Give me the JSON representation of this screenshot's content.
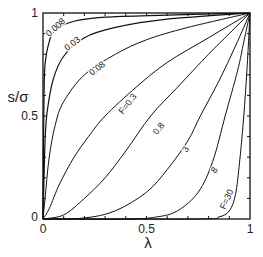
{
  "chart_data": {
    "type": "line",
    "title": "",
    "xlabel": "λ",
    "ylabel": "s/σ",
    "xlim": [
      0,
      1
    ],
    "ylim": [
      0,
      1
    ],
    "grid": false,
    "legend": "inline curve labels",
    "x_ticks": [
      {
        "value": 0,
        "label": "0"
      },
      {
        "value": 0.5,
        "label": "0.5"
      },
      {
        "value": 1,
        "label": "1"
      }
    ],
    "y_ticks": [
      {
        "value": 0,
        "label": "0"
      },
      {
        "value": 0.5,
        "label": "0.5"
      },
      {
        "value": 1,
        "label": "1"
      }
    ],
    "series": [
      {
        "name": "0.008",
        "label": "0.008",
        "label_pos": [
          0.07,
          0.92
        ],
        "label_rot": 42,
        "points": [
          [
            0,
            0
          ],
          [
            0.002,
            0.3
          ],
          [
            0.005,
            0.6
          ],
          [
            0.01,
            0.75
          ],
          [
            0.03,
            0.86
          ],
          [
            0.06,
            0.92
          ],
          [
            0.15,
            0.96
          ],
          [
            0.3,
            0.98
          ],
          [
            0.6,
            0.99
          ],
          [
            1,
            1
          ]
        ]
      },
      {
        "name": "0.03",
        "label": "0.03",
        "label_pos": [
          0.15,
          0.84
        ],
        "label_rot": 38,
        "points": [
          [
            0,
            0
          ],
          [
            0.005,
            0.2
          ],
          [
            0.01,
            0.38
          ],
          [
            0.02,
            0.52
          ],
          [
            0.05,
            0.68
          ],
          [
            0.1,
            0.79
          ],
          [
            0.2,
            0.88
          ],
          [
            0.35,
            0.93
          ],
          [
            0.6,
            0.97
          ],
          [
            1,
            1
          ]
        ]
      },
      {
        "name": "0.08",
        "label": "0.08",
        "label_pos": [
          0.27,
          0.72
        ],
        "label_rot": 38,
        "points": [
          [
            0,
            0
          ],
          [
            0.01,
            0.1
          ],
          [
            0.03,
            0.3
          ],
          [
            0.06,
            0.46
          ],
          [
            0.1,
            0.57
          ],
          [
            0.2,
            0.7
          ],
          [
            0.35,
            0.8
          ],
          [
            0.5,
            0.87
          ],
          [
            0.7,
            0.93
          ],
          [
            1,
            1
          ]
        ]
      },
      {
        "name": "0.3",
        "label": "F=0.3",
        "label_pos": [
          0.42,
          0.55
        ],
        "label_rot": 52,
        "points": [
          [
            0,
            0
          ],
          [
            0.03,
            0.05
          ],
          [
            0.08,
            0.17
          ],
          [
            0.15,
            0.3
          ],
          [
            0.22,
            0.4
          ],
          [
            0.3,
            0.5
          ],
          [
            0.45,
            0.64
          ],
          [
            0.6,
            0.76
          ],
          [
            0.8,
            0.88
          ],
          [
            1,
            1
          ]
        ]
      },
      {
        "name": "0.8",
        "label": "0.8",
        "label_pos": [
          0.57,
          0.43
        ],
        "label_rot": 52,
        "points": [
          [
            0,
            0
          ],
          [
            0.1,
            0.02
          ],
          [
            0.2,
            0.1
          ],
          [
            0.3,
            0.2
          ],
          [
            0.4,
            0.33
          ],
          [
            0.52,
            0.5
          ],
          [
            0.65,
            0.64
          ],
          [
            0.8,
            0.8
          ],
          [
            0.9,
            0.9
          ],
          [
            1,
            1
          ]
        ]
      },
      {
        "name": "3",
        "label": "3",
        "label_pos": [
          0.7,
          0.33
        ],
        "label_rot": 55,
        "points": [
          [
            0,
            0
          ],
          [
            0.2,
            0.005
          ],
          [
            0.35,
            0.04
          ],
          [
            0.5,
            0.13
          ],
          [
            0.6,
            0.24
          ],
          [
            0.7,
            0.38
          ],
          [
            0.76,
            0.5
          ],
          [
            0.85,
            0.67
          ],
          [
            0.93,
            0.84
          ],
          [
            1,
            1
          ]
        ]
      },
      {
        "name": "8",
        "label": "8",
        "label_pos": [
          0.84,
          0.23
        ],
        "label_rot": 58,
        "points": [
          [
            0,
            0
          ],
          [
            0.4,
            0.0
          ],
          [
            0.55,
            0.01
          ],
          [
            0.65,
            0.04
          ],
          [
            0.75,
            0.13
          ],
          [
            0.82,
            0.28
          ],
          [
            0.88,
            0.5
          ],
          [
            0.94,
            0.72
          ],
          [
            0.97,
            0.86
          ],
          [
            1,
            1
          ]
        ]
      },
      {
        "name": "30",
        "label": "F=30",
        "label_pos": [
          0.9,
          0.09
        ],
        "label_rot": 65,
        "points": [
          [
            0,
            0
          ],
          [
            0.75,
            0.0
          ],
          [
            0.85,
            0.01
          ],
          [
            0.9,
            0.04
          ],
          [
            0.93,
            0.12
          ],
          [
            0.95,
            0.28
          ],
          [
            0.97,
            0.5
          ],
          [
            0.985,
            0.72
          ],
          [
            0.995,
            0.9
          ],
          [
            1,
            1
          ]
        ]
      }
    ]
  }
}
